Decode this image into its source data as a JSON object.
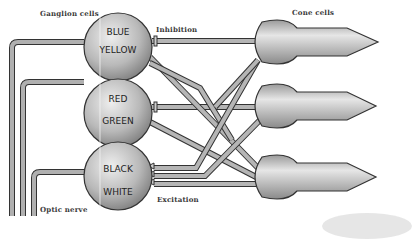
{
  "labels": {
    "ganglion_cells": "Ganglion cells",
    "cone_cells": "Cone cells",
    "inhibition": "Inhibition",
    "excitation": "Excitation",
    "optic_nerve": "Optic nerve"
  },
  "ganglion": [
    {
      "top": "BLUE",
      "bottom": "YELLOW"
    },
    {
      "top": "RED",
      "bottom": "GREEN"
    },
    {
      "top": "BLACK",
      "bottom": "WHITE"
    }
  ],
  "colors": {
    "fill_light": "#e8e8e8",
    "fill_dark": "#8a8a8a",
    "stroke": "#333333",
    "fiber": "#a9a9a9",
    "text": "#222222"
  }
}
